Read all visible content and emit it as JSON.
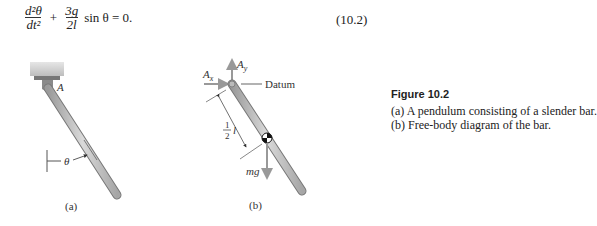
{
  "equation": {
    "term1_num": "d²θ",
    "term1_den": "dt²",
    "plus": "+",
    "term2_num": "3g",
    "term2_den": "2l",
    "rest": "sin θ = 0.",
    "number": "(10.2)"
  },
  "figure": {
    "title": "Figure 10.2",
    "caption_a": "(a) A pendulum consisting of a slender bar.",
    "caption_b": "(b) Free-body diagram of the bar.",
    "panel_a": {
      "label": "(a)",
      "pivot_label": "A",
      "angle_label": "θ"
    },
    "panel_b": {
      "label": "(b)",
      "ax_label": "A",
      "ax_sub": "x",
      "ay_label": "A",
      "ay_sub": "y",
      "datum_label": "Datum",
      "half_num": "1",
      "half_den": "2",
      "half_var": "l",
      "weight_label": "mg"
    }
  }
}
